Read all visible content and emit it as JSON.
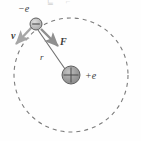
{
  "figure": {
    "background_color": "#fefefe",
    "ink_color": "#4a4a4a",
    "top_artifact_text": "⊑ ⌐"
  },
  "orbit": {
    "name": "electron-orbit",
    "style": "dashed",
    "center_x": 71,
    "center_y": 75,
    "radius": 57,
    "stroke_color": "#7c7c7c",
    "dash_pattern": "4 4"
  },
  "nucleus": {
    "label": "+e",
    "sign_glyph": "+",
    "center_x": 71,
    "center_y": 75,
    "radius": 9,
    "fill_color": "#9a9a9a",
    "stroke_color": "#5a5a5a",
    "label_x": 85,
    "label_y": 79
  },
  "electron": {
    "label": "−e",
    "sign_glyph": "−",
    "center_x": 36,
    "center_y": 24,
    "radius": 6,
    "fill_color": "#b8b8b8",
    "stroke_color": "#5a5a5a",
    "label_x": 18,
    "label_y": 12
  },
  "vectors": [
    {
      "name": "velocity-vector",
      "label": "v",
      "x1": 32,
      "y1": 27,
      "x2": 16,
      "y2": 44,
      "label_x": 11,
      "label_y": 39,
      "color": "#a6a6a6"
    },
    {
      "name": "force-vector",
      "label": "F",
      "x1": 41,
      "y1": 29,
      "x2": 58,
      "y2": 46,
      "label_x": 60,
      "label_y": 45,
      "color": "#8f8f8f"
    }
  ],
  "radius_line": {
    "name": "radius-line",
    "label": "r",
    "x1": 38,
    "y1": 30,
    "x2": 65,
    "y2": 69,
    "label_x": 40,
    "label_y": 60,
    "color": "#6f6f6f"
  }
}
